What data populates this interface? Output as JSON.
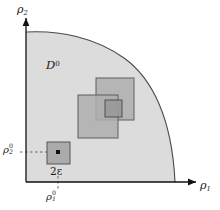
{
  "figure": {
    "type": "diagram",
    "background_color": "#ffffff",
    "region_fill": "#d9d9d9",
    "region_stroke": "#3a3a3a",
    "square_fill": "#a8a8a8",
    "square_stroke": "#5a5a5a",
    "axis_color": "#1a1a1a",
    "point_color": "#111111"
  },
  "axes": {
    "x_label": "ρ",
    "x_label_sub": "1",
    "y_label": "ρ",
    "y_label_sub": "2",
    "origin_label": ""
  },
  "labels": {
    "region": "D",
    "region_sup": "0",
    "epsilon_box": "2ε",
    "tick_y": "ρ",
    "tick_y_sub": "2",
    "tick_y_sup": "0",
    "tick_x": "ρ",
    "tick_x_sub": "1",
    "tick_x_sup": "0"
  },
  "geometry": {
    "origin": [
      26,
      182
    ],
    "x_axis_end": [
      196,
      182
    ],
    "y_axis_end": [
      26,
      18
    ],
    "region_arc_start": [
      26,
      32
    ],
    "region_arc_end": [
      175,
      182
    ],
    "squares": [
      {
        "name": "upper-right-square",
        "x": 96,
        "y": 78,
        "w": 38,
        "h": 42
      },
      {
        "name": "lower-left-square",
        "x": 78,
        "y": 95,
        "w": 40,
        "h": 43
      },
      {
        "name": "inner-small-square",
        "x": 105,
        "y": 100,
        "w": 17,
        "h": 17
      },
      {
        "name": "epsilon-square",
        "x": 47,
        "y": 142,
        "w": 23,
        "h": 22
      }
    ],
    "marked_point": [
      58,
      152
    ],
    "tick_y_position": [
      26,
      152
    ],
    "tick_x_position": [
      58,
      182
    ]
  }
}
